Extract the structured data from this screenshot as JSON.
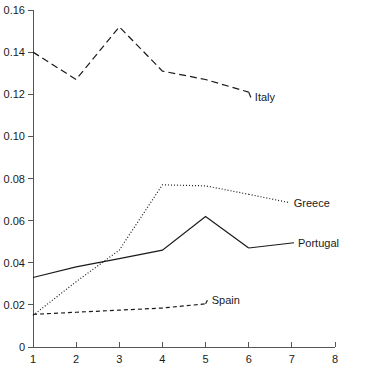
{
  "chart_data": {
    "type": "line",
    "title": "",
    "subtitle": "",
    "xlabel": "",
    "ylabel": "",
    "xlim": [
      1,
      8
    ],
    "ylim": [
      0,
      0.16
    ],
    "grid": false,
    "legend_position": "inline-right-labels",
    "x": [
      1,
      2,
      3,
      4,
      5,
      6,
      7,
      8
    ],
    "x_tick_labels": [
      "1",
      "2",
      "3",
      "4",
      "5",
      "6",
      "7",
      "8"
    ],
    "y_tick_values": [
      0,
      0.02,
      0.04,
      0.06,
      0.08,
      0.1,
      0.12,
      0.14,
      0.16
    ],
    "y_tick_labels": [
      "0",
      "0.02",
      "0.04",
      "0.06",
      "0.08",
      "0.10",
      "0.12",
      "0.14",
      "0.16"
    ],
    "series": [
      {
        "name": "Italy",
        "label": "Italy",
        "style": "dashed",
        "color": "#1a1a1a",
        "x": [
          1,
          2,
          3,
          4,
          5,
          6
        ],
        "values": [
          0.14,
          0.127,
          0.152,
          0.131,
          0.127,
          0.121
        ],
        "label_x": 6.05,
        "label_y": 0.1185
      },
      {
        "name": "Greece",
        "label": "Greece",
        "style": "dotted",
        "color": "#1a1a1a",
        "x": [
          1,
          2,
          3,
          4,
          5,
          6
        ],
        "values": [
          0.015,
          0.031,
          0.046,
          0.077,
          0.0765,
          0.0725
        ],
        "label_x": 6.95,
        "label_y": 0.0685
      },
      {
        "name": "Portugal",
        "label": "Portugal",
        "style": "solid",
        "color": "#1a1a1a",
        "x": [
          1,
          2,
          3,
          4,
          5,
          6
        ],
        "values": [
          0.033,
          0.038,
          0.042,
          0.046,
          0.062,
          0.047
        ],
        "label_x": 7.05,
        "label_y": 0.0495
      },
      {
        "name": "Spain",
        "label": "Spain",
        "style": "short-dashed",
        "color": "#1a1a1a",
        "x": [
          1,
          2,
          3,
          4,
          5
        ],
        "values": [
          0.0155,
          0.0165,
          0.0175,
          0.0185,
          0.0205
        ],
        "label_x": 5.05,
        "label_y": 0.0225
      }
    ]
  }
}
